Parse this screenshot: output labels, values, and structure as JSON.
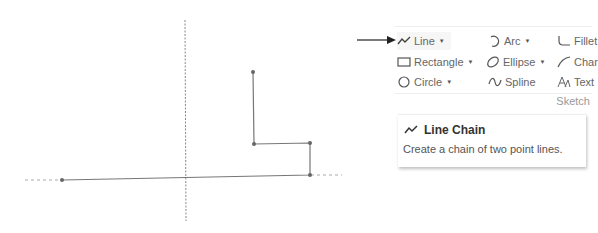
{
  "ribbon": {
    "group_label": "Sketch",
    "tools": [
      {
        "id": "line",
        "label": "Line",
        "icon": "line-chain-icon",
        "dropdown": true,
        "active": true
      },
      {
        "id": "arc",
        "label": "Arc",
        "icon": "arc-icon",
        "dropdown": true
      },
      {
        "id": "fillet",
        "label": "Fillet",
        "icon": "fillet-icon",
        "dropdown": false
      },
      {
        "id": "rectangle",
        "label": "Rectangle",
        "icon": "rectangle-icon",
        "dropdown": true
      },
      {
        "id": "ellipse",
        "label": "Ellipse",
        "icon": "ellipse-icon",
        "dropdown": true
      },
      {
        "id": "chamfer",
        "label": "Char",
        "icon": "chamfer-icon",
        "dropdown": false
      },
      {
        "id": "circle",
        "label": "Circle",
        "icon": "circle-icon",
        "dropdown": true
      },
      {
        "id": "spline",
        "label": "Spline",
        "icon": "spline-icon",
        "dropdown": false
      },
      {
        "id": "text",
        "label": "Text",
        "icon": "text-icon",
        "dropdown": false
      }
    ]
  },
  "tooltip": {
    "title": "Line Chain",
    "icon": "line-chain-icon",
    "description": "Create a chain of two point lines."
  },
  "sketch": {
    "vertical_axis": {
      "x": 185,
      "y1": 20,
      "y2": 221
    },
    "horizontal_construction": [
      {
        "x1": 25,
        "y1": 180,
        "x2": 62,
        "y2": 180
      },
      {
        "x1": 310,
        "y1": 175,
        "x2": 342,
        "y2": 175
      }
    ],
    "line_chain_points": [
      [
        253,
        72
      ],
      [
        254,
        144
      ],
      [
        310,
        143
      ],
      [
        310,
        175
      ],
      [
        62,
        180
      ]
    ],
    "colors": {
      "line": "#777777",
      "point": "#666666",
      "axis": "#888888"
    }
  },
  "annotation": {
    "arrow_color": "#222222"
  }
}
